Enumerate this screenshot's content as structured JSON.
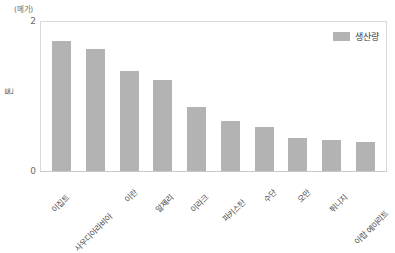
{
  "chart_data": {
    "type": "bar",
    "title": "",
    "xlabel": "",
    "ylabel": "톤",
    "unit_label": "(메가)",
    "ylim": [
      0,
      2
    ],
    "yticks": [
      "0",
      "2"
    ],
    "grid": false,
    "legend_position": "top-right",
    "legend": [
      "생산량"
    ],
    "categories": [
      "이집트",
      "사우디아라비아",
      "이란",
      "알제리",
      "이라크",
      "파키스탄",
      "수단",
      "오만",
      "튀니지",
      "아랍 에미리트"
    ],
    "series": [
      {
        "name": "생산량",
        "color": "#b3b3b3",
        "values": [
          1.72,
          1.61,
          1.33,
          1.21,
          0.85,
          0.66,
          0.58,
          0.44,
          0.41,
          0.38
        ]
      }
    ]
  },
  "axis": {
    "unit_label": "(메가)",
    "y_title": "톤",
    "tick_top": "2",
    "tick_zero": "0"
  },
  "legend": {
    "label": "생산량",
    "swatch_color": "#b3b3b3"
  }
}
